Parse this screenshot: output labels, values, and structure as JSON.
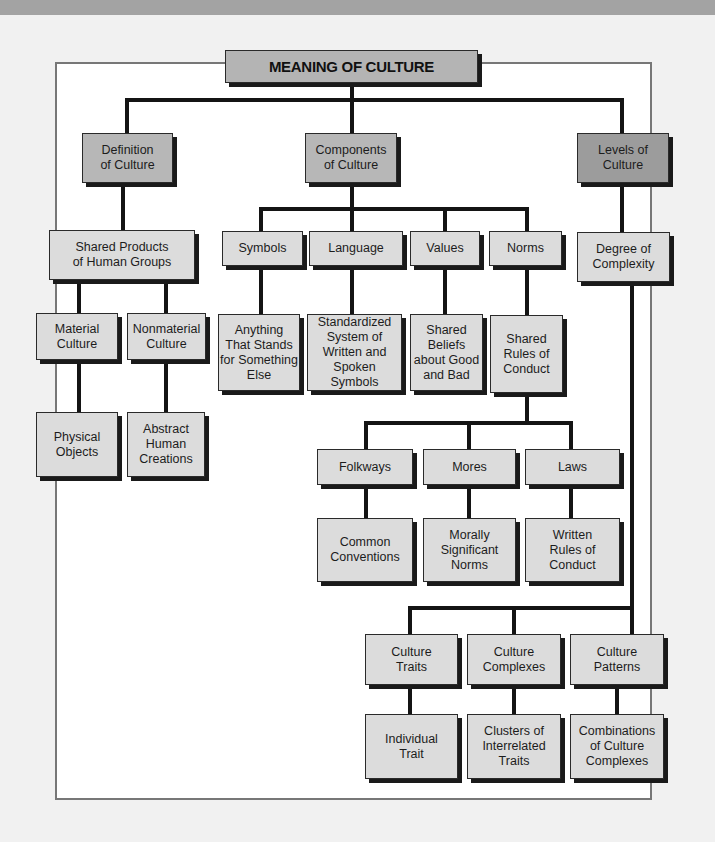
{
  "title": "MEANING OF CULTURE",
  "colors": {
    "title_fill": "#b4b4b4",
    "level1_fill": "#b7b7b7",
    "levels_fill": "#9c9c9c",
    "node_fill": "#dcdcdc",
    "line": "#141414",
    "frame": "#777777"
  },
  "nodes": {
    "definition": "Definition\nof Culture",
    "components": "Components\nof Culture",
    "levels": "Levels of\nCulture",
    "shared_products": "Shared Products\nof Human Groups",
    "material": "Material\nCulture",
    "nonmaterial": "Nonmaterial\nCulture",
    "physical": "Physical\nObjects",
    "abstract": "Abstract\nHuman\nCreations",
    "symbols": "Symbols",
    "language": "Language",
    "values": "Values",
    "norms": "Norms",
    "symbols_def": "Anything\nThat Stands\nfor Something\nElse",
    "language_def": "Standardized\nSystem of\nWritten and\nSpoken Symbols",
    "values_def": "Shared\nBeliefs\nabout Good\nand Bad",
    "norms_def": "Shared\nRules of\nConduct",
    "folkways": "Folkways",
    "mores": "Mores",
    "laws": "Laws",
    "folkways_def": "Common\nConventions",
    "mores_def": "Morally\nSignificant\nNorms",
    "laws_def": "Written\nRules of\nConduct",
    "degree": "Degree of\nComplexity",
    "traits": "Culture\nTraits",
    "complexes": "Culture\nComplexes",
    "patterns": "Culture\nPatterns",
    "traits_def": "Individual\nTrait",
    "complexes_def": "Clusters of\nInterrelated\nTraits",
    "patterns_def": "Combinations\nof Culture\nComplexes"
  }
}
